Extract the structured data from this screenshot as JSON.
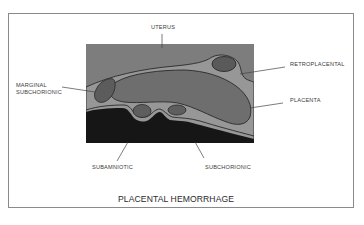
{
  "figure": {
    "title": "PLACENTAL HEMORRHAGE",
    "labels": {
      "uterus": "UTERUS",
      "retroplacental": "RETROPLACENTAL",
      "marginal_line1": "MARGINAL",
      "marginal_line2": "SUBCHORIONIC",
      "placenta": "PLACENTA",
      "subamniotic": "SUBAMNIOTIC",
      "subchorionic": "SUBCHORIONIC"
    },
    "colors": {
      "frame_border": "#8a8a8a",
      "uterus_gray": "#7d7d7d",
      "placenta_gray": "#6e6e6e",
      "membrane_light": "#9a9a9a",
      "hemorrhage_dark": "#555555",
      "amniotic_black": "#161616",
      "outline": "#2a2a2a",
      "leader_line": "#444444"
    }
  }
}
